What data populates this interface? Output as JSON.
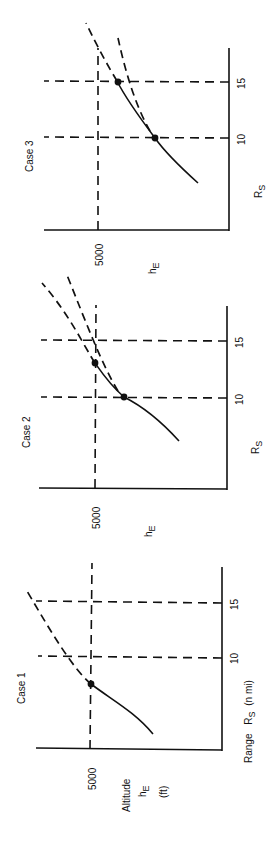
{
  "figure": {
    "orientation": "rotated-90-ccw",
    "panels": [
      {
        "id": "case1",
        "title": "Case 1",
        "y_axis_label": "Altitude",
        "y_axis_symbol": "h",
        "y_axis_subscript": "E",
        "y_axis_unit": "(ft)",
        "y_tick": "5000",
        "x_axis_label": "Range",
        "x_axis_symbol": "R",
        "x_axis_subscript": "S",
        "x_axis_unit": "(n mi)",
        "x_ticks": [
          "10",
          "15"
        ],
        "intersections": 1
      },
      {
        "id": "case2",
        "title": "Case 2",
        "y_axis_symbol": "h",
        "y_axis_subscript": "E",
        "y_tick": "5000",
        "x_axis_symbol": "R",
        "x_axis_subscript": "S",
        "x_ticks": [
          "10",
          "15"
        ],
        "intersections": 2
      },
      {
        "id": "case3",
        "title": "Case 3",
        "y_axis_symbol": "h",
        "y_axis_subscript": "E",
        "y_tick": "5000",
        "x_axis_symbol": "R",
        "x_axis_subscript": "S",
        "x_ticks": [
          "10",
          "15"
        ],
        "intersections": 2
      }
    ]
  },
  "colors": {
    "ink": "#111111",
    "background": "#ffffff"
  }
}
